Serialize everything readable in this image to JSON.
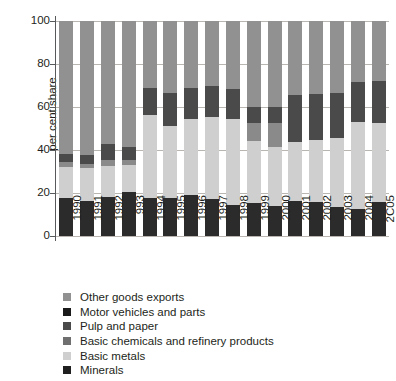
{
  "chart_data": {
    "type": "bar",
    "subtype": "stacked-bar-100",
    "title": "",
    "xlabel": "",
    "ylabel": "per cent share",
    "ylim": [
      0,
      100
    ],
    "yticks": [
      0,
      20,
      40,
      60,
      80,
      100
    ],
    "grid": true,
    "legend_position": "bottom-left",
    "categories": [
      "1990",
      "1991",
      "1992",
      "993",
      "1994",
      "1995",
      "1996",
      "1997",
      "1998",
      "1999",
      "2000",
      "2001",
      "2002",
      "2003",
      "2004",
      "2C05"
    ],
    "series": [
      {
        "name": "Minerals",
        "color": "#2b2b2b",
        "values": [
          17.5,
          16.5,
          18.0,
          20.5,
          17.5,
          17.5,
          19.0,
          17.0,
          14.5,
          15.5,
          14.0,
          16.5,
          16.0,
          13.5,
          12.5,
          16.0
        ]
      },
      {
        "name": "Basic metals",
        "color": "#cfcfcf",
        "values": [
          14.5,
          15.0,
          14.5,
          12.5,
          39.0,
          33.5,
          35.5,
          38.5,
          40.0,
          28.5,
          27.5,
          27.0,
          28.5,
          32.0,
          40.5,
          36.5
        ]
      },
      {
        "name": "Basic chemicals and refinery products",
        "color": "#8a8a8a",
        "values": [
          2.5,
          2.0,
          3.0,
          2.5,
          0.0,
          0.0,
          0.0,
          0.0,
          0.0,
          8.5,
          11.0,
          0.0,
          0.0,
          0.0,
          0.0,
          0.0
        ]
      },
      {
        "name": "Pulp and paper",
        "color": "#4a4a4a",
        "values": [
          3.5,
          4.0,
          7.5,
          6.0,
          12.5,
          15.5,
          14.5,
          14.5,
          14.0,
          7.5,
          7.5,
          22.0,
          21.5,
          21.0,
          18.5,
          19.5
        ]
      },
      {
        "name": "Motor vehicles and parts",
        "color": "#1a1a1a",
        "values": [
          0.0,
          0.0,
          0.0,
          0.0,
          0.0,
          0.0,
          0.0,
          0.0,
          0.0,
          0.0,
          0.0,
          0.0,
          0.0,
          0.0,
          0.0,
          0.0
        ]
      },
      {
        "name": "Other goods exports",
        "color": "#919191",
        "values": [
          62.0,
          62.5,
          57.0,
          58.5,
          31.0,
          33.5,
          31.0,
          30.0,
          31.5,
          40.0,
          40.0,
          34.5,
          34.0,
          33.5,
          28.5,
          28.0
        ]
      }
    ]
  },
  "axis": {
    "y_title": "per cent share",
    "y_ticks": [
      "100",
      "80",
      "60",
      "40",
      "20",
      "0"
    ]
  },
  "legend": {
    "items": [
      {
        "label": "Other goods exports",
        "color": "#919191"
      },
      {
        "label": "Motor vehicles and parts",
        "color": "#1a1a1a"
      },
      {
        "label": "Pulp and paper",
        "color": "#4a4a4a"
      },
      {
        "label": "Basic chemicals and refinery products",
        "color": "#6f6f6f"
      },
      {
        "label": "Basic metals",
        "color": "#cfcfcf"
      },
      {
        "label": "Minerals",
        "color": "#1f1f1f"
      }
    ]
  }
}
